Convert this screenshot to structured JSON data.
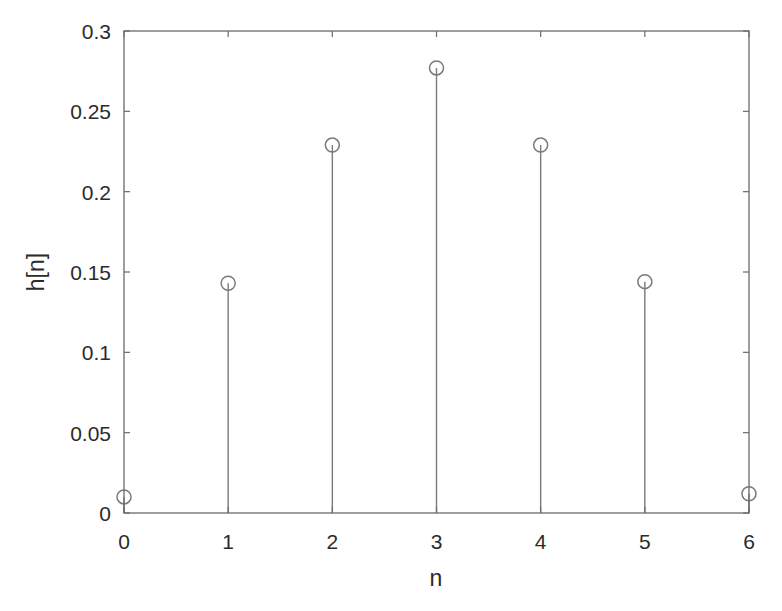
{
  "chart_data": {
    "type": "stem",
    "title": "",
    "xlabel": "n",
    "ylabel": "h[n]",
    "x": [
      0,
      1,
      2,
      3,
      4,
      5,
      6
    ],
    "values": [
      0.01,
      0.143,
      0.229,
      0.277,
      0.229,
      0.144,
      0.012
    ],
    "xlim": [
      0,
      6
    ],
    "ylim": [
      0,
      0.3
    ],
    "xticks": [
      0,
      1,
      2,
      3,
      4,
      5,
      6
    ],
    "xtick_labels": [
      "0",
      "1",
      "2",
      "3",
      "4",
      "5",
      "6"
    ],
    "yticks": [
      0,
      0.05,
      0.1,
      0.15,
      0.2,
      0.25,
      0.3
    ],
    "ytick_labels": [
      "0",
      "0.05",
      "0.1",
      "0.15",
      "0.2",
      "0.25",
      "0.3"
    ],
    "grid": false,
    "legend": null,
    "marker": "open-circle",
    "colors": {
      "stem": "#7a7a7a",
      "axes": "#6b6b6b",
      "text": "#2b2b2b"
    }
  }
}
